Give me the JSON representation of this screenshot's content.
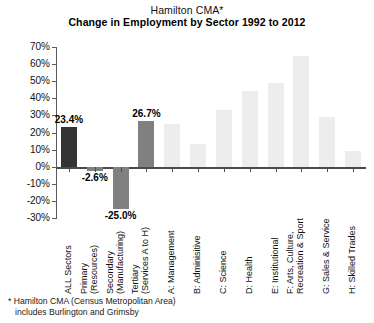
{
  "chart_data": {
    "type": "bar",
    "title": "Change in Employment by Sector 1992 to 2012",
    "supertitle": "Hamilton CMA*",
    "xlabel": "",
    "ylabel": "",
    "ylim": [
      -30,
      70
    ],
    "ytick_step": 10,
    "grid": false,
    "legend": null,
    "categories": [
      "ALL Sectors",
      "Primary (Resources)",
      "Secondary (Manufacturing)",
      "Tertiary (Services A to H)",
      "A: Management",
      "B: Adminisitive",
      "C: Science",
      "D: Health",
      "E: Institutional",
      "F: Arts, Culture, Recreation & Sport",
      "G: Sales & Service",
      "H: Skilled Trades"
    ],
    "category_lines": [
      [
        "ALL Sectors",
        ""
      ],
      [
        "Primary",
        "(Resources)"
      ],
      [
        "Secondary",
        "(Manufacturing)"
      ],
      [
        "Tertiary",
        "(Services A to H)"
      ],
      [
        "A: Management",
        ""
      ],
      [
        "B: Adminisitive",
        ""
      ],
      [
        "C: Science",
        ""
      ],
      [
        "D: Health",
        ""
      ],
      [
        "E: Institutional",
        ""
      ],
      [
        "F: Arts, Culture,",
        "Recreation & Sport"
      ],
      [
        "G: Sales & Service",
        ""
      ],
      [
        "H: Skilled Trades",
        ""
      ]
    ],
    "values": [
      23.4,
      -2.6,
      -25.0,
      26.7,
      25.0,
      13.0,
      33.0,
      44.0,
      49.0,
      65.0,
      29.0,
      9.0
    ],
    "value_labels": [
      "23.4%",
      "-2.6%",
      "-25.0%",
      "26.7%",
      "",
      "",
      "",
      "",
      "",
      "",
      "",
      ""
    ],
    "bar_colors": [
      "#333333",
      "#808080",
      "#808080",
      "#808080",
      "#ededed",
      "#ededed",
      "#ededed",
      "#ededed",
      "#ededed",
      "#ededed",
      "#ededed",
      "#ededed"
    ],
    "ytick_labels": [
      "70%",
      "60%",
      "50%",
      "40%",
      "30%",
      "20%",
      "10%",
      "0%",
      "-10%",
      "-20%",
      "-30%"
    ],
    "ytick_values": [
      70,
      60,
      50,
      40,
      30,
      20,
      10,
      0,
      -10,
      -20,
      -30
    ]
  },
  "footnote": {
    "line1": "* Hamilton CMA (Census Metropolitan Area)",
    "line2": "includes Burlington and Grimsby"
  },
  "colors": {
    "axis": "#4a4a4a",
    "text": "#111111",
    "dark_bar": "#333333",
    "mid_bar": "#808080",
    "light_bar": "#ededed"
  }
}
